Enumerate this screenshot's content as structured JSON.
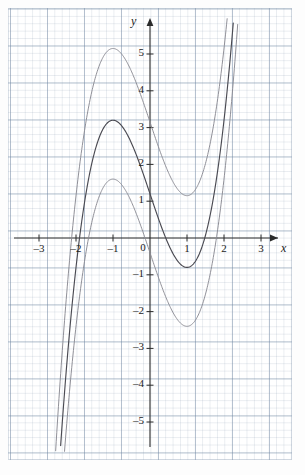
{
  "chart_data": {
    "type": "line",
    "title": "",
    "xlabel": "x",
    "ylabel": "y",
    "xlim": [
      -3.85,
      3.65
    ],
    "ylim": [
      -6.2,
      6.2
    ],
    "grid": true,
    "legend": "none",
    "x_ticks": [
      -3,
      -2,
      -1,
      0,
      1,
      2,
      3
    ],
    "x_tick_labels": [
      "–3",
      "–2",
      "–1",
      "0",
      "1",
      "2",
      "3"
    ],
    "y_ticks": [
      5,
      4,
      3,
      2,
      1,
      -1,
      -2,
      -3,
      -4,
      -5
    ],
    "y_tick_labels": [
      "5",
      "4",
      "3",
      "2",
      "1",
      "–1",
      "–2",
      "–3",
      "–4",
      "–5"
    ],
    "origin_label": "0",
    "series": [
      {
        "name": "cubic-upper",
        "expression": "y = x^3 - 3x + 1.1",
        "color": "#8a8a92",
        "local_max": {
          "x": -1.0,
          "y": 5.15
        },
        "local_min": {
          "x": 1.0,
          "y": -1.1
        },
        "points": [
          [
            -2.75,
            -11.5
          ],
          [
            -2.5,
            -7.1
          ],
          [
            -2.25,
            -3.8
          ],
          [
            -2.0,
            -1.4
          ],
          [
            -1.75,
            0.6
          ],
          [
            -1.5,
            2.2
          ],
          [
            -1.25,
            3.5
          ],
          [
            -1.0,
            4.3
          ],
          [
            -0.75,
            4.7
          ],
          [
            -0.5,
            4.8
          ],
          [
            -0.25,
            4.6
          ],
          [
            0.0,
            4.2
          ],
          [
            0.25,
            3.6
          ],
          [
            0.5,
            2.8
          ],
          [
            0.75,
            2.0
          ],
          [
            1.0,
            1.2
          ],
          [
            1.25,
            0.5
          ],
          [
            1.5,
            0.0
          ],
          [
            1.75,
            -0.2
          ],
          [
            2.0,
            0.0
          ],
          [
            2.25,
            0.8
          ],
          [
            2.5,
            2.2
          ],
          [
            2.75,
            4.4
          ],
          [
            3.0,
            7.5
          ]
        ]
      },
      {
        "name": "cubic-middle",
        "expression": "y = x^3 - 3x - 0.15",
        "color": "#4a4a52",
        "local_max": {
          "x": -1.0,
          "y": 3.2
        },
        "local_min": {
          "x": 1.0,
          "y": -1.45
        },
        "points": []
      },
      {
        "name": "cubic-lower",
        "expression": "y = x^3 - 3x - 1.9",
        "color": "#8a8a92",
        "local_max": {
          "x": -1.0,
          "y": 1.6
        },
        "local_min": {
          "x": 1.0,
          "y": -3.05
        },
        "points": []
      }
    ],
    "annotations": [],
    "geometry": {
      "origin_px": [
        150,
        238
      ],
      "unit_px_x": 37,
      "unit_px_y": 36.8
    }
  },
  "axes": {
    "x_axis_label": "x",
    "y_axis_label": "y"
  }
}
